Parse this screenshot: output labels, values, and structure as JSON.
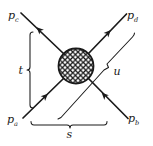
{
  "diagram": {
    "title": "",
    "type": "scattering-diagram",
    "momenta": {
      "a": {
        "symbol": "p",
        "subscript": "a"
      },
      "b": {
        "symbol": "p",
        "subscript": "b"
      },
      "c": {
        "symbol": "p",
        "subscript": "c"
      },
      "d": {
        "symbol": "p",
        "subscript": "d"
      }
    },
    "channels": {
      "s": "s",
      "t": "t",
      "u": "u"
    },
    "colors": {
      "ink": "#1a1a1a",
      "background": "#ffffff"
    }
  }
}
